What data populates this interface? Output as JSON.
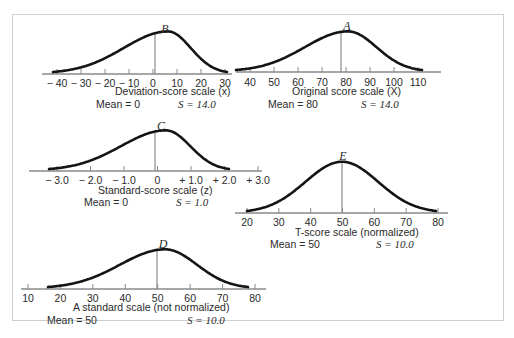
{
  "figure": {
    "panels": [
      {
        "id": "B",
        "letter": "B",
        "scale_label": "Deviation-score scale (x)",
        "mean_label": "Mean = 0",
        "sd_label": "S = 14.0",
        "ticks": [
          "− 40",
          "− 30",
          "− 20",
          "− 10",
          "0",
          "10",
          "20",
          "30"
        ],
        "tick_values": [
          -40,
          -30,
          -20,
          -10,
          0,
          10,
          20,
          30
        ],
        "mean": 0,
        "sd": 14.0
      },
      {
        "id": "A",
        "letter": "A",
        "scale_label": "Original score scale (X)",
        "mean_label": "Mean = 80",
        "sd_label": "S = 14.0",
        "ticks": [
          "40",
          "50",
          "60",
          "70",
          "80",
          "90",
          "100",
          "110"
        ],
        "tick_values": [
          40,
          50,
          60,
          70,
          80,
          90,
          100,
          110
        ],
        "mean": 80,
        "sd": 14.0
      },
      {
        "id": "C",
        "letter": "C",
        "scale_label": "Standard-score scale (z)",
        "mean_label": "Mean = 0",
        "sd_label": "S = 1.0",
        "ticks": [
          "− 3.0",
          "− 2.0",
          "− 1.0",
          "0",
          "+ 1.0",
          "+ 2.0",
          "+ 3.0"
        ],
        "tick_values": [
          -3,
          -2,
          -1,
          0,
          1,
          2,
          3
        ],
        "mean": 0,
        "sd": 1.0
      },
      {
        "id": "E",
        "letter": "E",
        "scale_label": "T-score scale (normalized)",
        "mean_label": "Mean = 50",
        "sd_label": "S = 10.0",
        "ticks": [
          "20",
          "30",
          "40",
          "50",
          "60",
          "70",
          "80"
        ],
        "tick_values": [
          20,
          30,
          40,
          50,
          60,
          70,
          80
        ],
        "mean": 50,
        "sd": 10.0
      },
      {
        "id": "D",
        "letter": "D",
        "scale_label": "A standard scale (not normalized)",
        "mean_label": "Mean = 50",
        "sd_label": "S = 10.0",
        "ticks": [
          "10",
          "20",
          "30",
          "40",
          "50",
          "60",
          "70",
          "80"
        ],
        "tick_values": [
          10,
          20,
          30,
          40,
          50,
          60,
          70,
          80
        ],
        "mean": 50,
        "sd": 10.0
      }
    ],
    "colors": {
      "curve": "#141414",
      "axis": "#8a8a8a",
      "frame": "#cfcfcf",
      "text": "#2a2a2a"
    }
  }
}
